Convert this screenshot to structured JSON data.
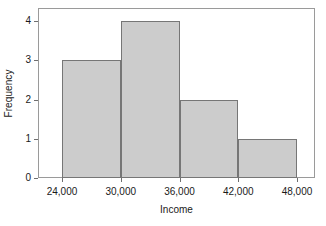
{
  "chart_data": {
    "type": "bar",
    "title": "",
    "subtitle": "",
    "xlabel": "Income",
    "ylabel": "Frequency",
    "categories": [
      "24,000-30,000",
      "30,000-36,000",
      "36,000-42,000",
      "42,000-48,000"
    ],
    "values": [
      3,
      4,
      2,
      1
    ],
    "bin_edges": [
      24000,
      30000,
      36000,
      42000,
      48000
    ],
    "x_tick_labels": [
      "24,000",
      "30,000",
      "36,000",
      "42,000",
      "48,000"
    ],
    "x_tick_values": [
      24000,
      30000,
      36000,
      42000,
      48000
    ],
    "y_tick_labels": [
      "0",
      "1",
      "2",
      "3",
      "4"
    ],
    "y_tick_values": [
      0,
      1,
      2,
      3,
      4
    ],
    "xlim": [
      22000,
      49200
    ],
    "ylim": [
      0,
      4.33
    ],
    "grid": false,
    "legend": false,
    "legend_position": "none",
    "bar_fill_color": "#cccccc",
    "bar_edge_color": "#767676",
    "frame_color": "#9a9a9a",
    "background_color": "#ffffff",
    "text_color": "#1a1a1a"
  },
  "axes": {
    "y": {
      "title": "Frequency",
      "ticks": [
        {
          "label": "4",
          "value": 4
        },
        {
          "label": "3",
          "value": 3
        },
        {
          "label": "2",
          "value": 2
        },
        {
          "label": "1",
          "value": 1
        },
        {
          "label": "0",
          "value": 0
        }
      ]
    },
    "x": {
      "title": "Income",
      "ticks": [
        {
          "label": "24,000",
          "value": 24000
        },
        {
          "label": "30,000",
          "value": 30000
        },
        {
          "label": "36,000",
          "value": 36000
        },
        {
          "label": "42,000",
          "value": 42000
        },
        {
          "label": "48,000",
          "value": 48000
        }
      ]
    }
  },
  "bars": [
    {
      "label": "24,000-30,000",
      "value": 3
    },
    {
      "label": "30,000-36,000",
      "value": 4
    },
    {
      "label": "36,000-42,000",
      "value": 2
    },
    {
      "label": "42,000-48,000",
      "value": 1
    }
  ]
}
